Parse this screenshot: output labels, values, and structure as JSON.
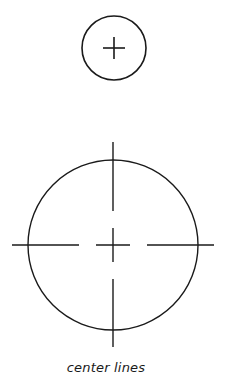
{
  "caption": "center lines",
  "colors": {
    "stroke": "#1a1a1a",
    "background": "#ffffff"
  },
  "small_circle": {
    "cx": 114,
    "cy": 48,
    "r": 32,
    "cross_half": 11
  },
  "large_circle": {
    "cx": 113,
    "cy": 245,
    "r": 85,
    "horizontal_segments": [
      [
        12,
        79
      ],
      [
        96,
        130
      ],
      [
        147,
        214
      ]
    ],
    "vertical_segments": [
      [
        142,
        211
      ],
      [
        228,
        262
      ],
      [
        279,
        347
      ]
    ]
  }
}
